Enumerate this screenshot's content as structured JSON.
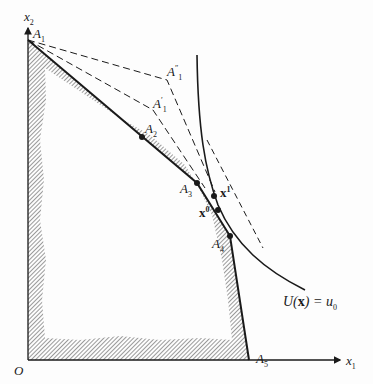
{
  "figure": {
    "axes": {
      "x_label": "x",
      "x_sub": "1",
      "y_label": "x",
      "y_sub": "2",
      "origin": "O"
    },
    "points": {
      "A1": {
        "base": "A",
        "sub": "1"
      },
      "A1p": {
        "base": "A",
        "sub": "1",
        "sup": "′"
      },
      "A1pp": {
        "base": "A",
        "sub": "1",
        "sup": "″"
      },
      "A2": {
        "base": "A",
        "sub": "2"
      },
      "A3": {
        "base": "A",
        "sub": "3"
      },
      "A4": {
        "base": "A",
        "sub": "4"
      },
      "A5": {
        "base": "A",
        "sub": "5"
      },
      "x0": {
        "base": "x",
        "sup": "0"
      },
      "x1": {
        "base": "x",
        "sup": "1"
      }
    },
    "curve_label": {
      "pre": "U(",
      "bold": "x",
      "post": ") = u",
      "sub": "0"
    },
    "colors": {
      "ink": "#1a1a1a",
      "hatch": "#555555",
      "background": "#fdfdfd"
    }
  }
}
